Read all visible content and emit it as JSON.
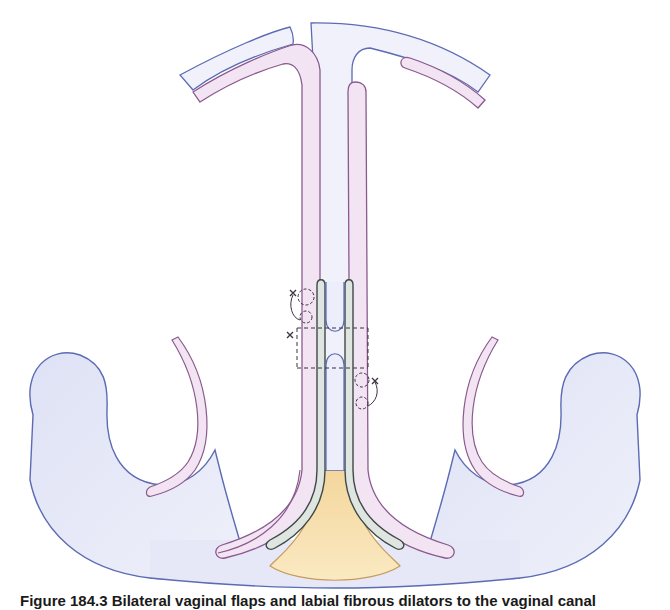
{
  "figure": {
    "caption": "Figure 184.3 Bilateral vaginal flaps and labial fibrous dilators to the vaginal canal",
    "colors": {
      "tissue_fill": "#e3e5f6",
      "tissue_stroke": "#5c6bb3",
      "flap_fill": "#f3e4f3",
      "flap_stroke": "#8a5a8e",
      "tube_fill": "#dfe5e1",
      "tube_stroke": "#3f4a46",
      "fat_fill": "#f7dfa6",
      "fat_stroke": "#c89a5c",
      "suture": "#3d3140"
    },
    "structures": [
      {
        "id": "upper-arch",
        "label": "upper tissue arch"
      },
      {
        "id": "left-pelvic-wall",
        "label": "left curved tissue"
      },
      {
        "id": "right-pelvic-wall",
        "label": "right curved tissue"
      },
      {
        "id": "central-canal",
        "label": "central canal"
      },
      {
        "id": "left-flap",
        "label": "left flap"
      },
      {
        "id": "right-flap",
        "label": "right flap"
      },
      {
        "id": "stent-tubes",
        "label": "stent tubes"
      },
      {
        "id": "fat-pad",
        "label": "fat pad"
      },
      {
        "id": "sutures",
        "label": "sutures"
      }
    ]
  }
}
